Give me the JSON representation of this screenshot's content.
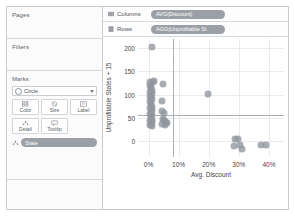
{
  "sidebar": {
    "pages": {
      "title": "Pages"
    },
    "filters": {
      "title": "Filters"
    },
    "marks": {
      "title": "Marks",
      "mark_type": "Circle",
      "buttons": [
        {
          "label": "Color",
          "icon": "color-icon"
        },
        {
          "label": "Size",
          "icon": "size-icon"
        },
        {
          "label": "Label",
          "icon": "label-icon"
        },
        {
          "label": "Detail",
          "icon": "detail-icon"
        },
        {
          "label": "Tooltip",
          "icon": "tooltip-icon"
        }
      ],
      "field_pill": "State"
    }
  },
  "shelves": {
    "columns": {
      "label": "Columns",
      "pill": "AVG(Discount)"
    },
    "rows": {
      "label": "Rows",
      "pill": "AGG(Unprofitable St"
    }
  },
  "chart_data": {
    "type": "scatter",
    "title": "",
    "xlabel": "Avg. Discount",
    "ylabel": "Unprofitable States + 15",
    "xlim": [
      -0.035,
      0.45
    ],
    "ylim": [
      -35,
      220
    ],
    "xticks": [
      0,
      0.1,
      0.2,
      0.3,
      0.4
    ],
    "xticklabels": [
      "0%",
      "10%",
      "20%",
      "30%",
      "40%"
    ],
    "yticks": [
      0,
      50,
      100,
      150,
      200
    ],
    "yticklabels": [
      "0",
      "50",
      "100",
      "150",
      "200"
    ],
    "grid": true,
    "legend": false,
    "reference_lines": [
      {
        "axis": "x",
        "value": 0.08,
        "color": "#a9afb6"
      },
      {
        "axis": "y",
        "value": 55,
        "color": "#a9afb6"
      }
    ],
    "marker": {
      "shape": "circle",
      "color": "#8f969d",
      "opacity": 0.78,
      "size": 7
    },
    "points": [
      {
        "x": 0.012,
        "y": 203
      },
      {
        "x": 0.006,
        "y": 128
      },
      {
        "x": 0.014,
        "y": 126
      },
      {
        "x": 0.019,
        "y": 129
      },
      {
        "x": 0.004,
        "y": 120
      },
      {
        "x": 0.009,
        "y": 117
      },
      {
        "x": 0.007,
        "y": 112
      },
      {
        "x": 0.011,
        "y": 108
      },
      {
        "x": 0.005,
        "y": 105
      },
      {
        "x": 0.01,
        "y": 101
      },
      {
        "x": 0.006,
        "y": 97
      },
      {
        "x": 0.008,
        "y": 93
      },
      {
        "x": 0.012,
        "y": 90
      },
      {
        "x": 0.005,
        "y": 86
      },
      {
        "x": 0.009,
        "y": 82
      },
      {
        "x": 0.007,
        "y": 78
      },
      {
        "x": 0.011,
        "y": 74
      },
      {
        "x": 0.006,
        "y": 70
      },
      {
        "x": 0.01,
        "y": 66
      },
      {
        "x": 0.008,
        "y": 62
      },
      {
        "x": 0.005,
        "y": 58
      },
      {
        "x": 0.012,
        "y": 55
      },
      {
        "x": 0.007,
        "y": 51
      },
      {
        "x": 0.009,
        "y": 47
      },
      {
        "x": 0.006,
        "y": 43
      },
      {
        "x": 0.011,
        "y": 40
      },
      {
        "x": 0.008,
        "y": 37
      },
      {
        "x": 0.004,
        "y": 34
      },
      {
        "x": 0.013,
        "y": 44
      },
      {
        "x": 0.01,
        "y": 31
      },
      {
        "x": 0.047,
        "y": 122
      },
      {
        "x": 0.044,
        "y": 86
      },
      {
        "x": 0.046,
        "y": 65
      },
      {
        "x": 0.05,
        "y": 61
      },
      {
        "x": 0.048,
        "y": 48
      },
      {
        "x": 0.053,
        "y": 44
      },
      {
        "x": 0.058,
        "y": 40
      },
      {
        "x": 0.045,
        "y": 36
      },
      {
        "x": 0.062,
        "y": 38
      },
      {
        "x": 0.056,
        "y": 35
      },
      {
        "x": 0.196,
        "y": 101
      },
      {
        "x": 0.287,
        "y": 4
      },
      {
        "x": 0.297,
        "y": 3
      },
      {
        "x": 0.283,
        "y": -12
      },
      {
        "x": 0.305,
        "y": -8
      },
      {
        "x": 0.312,
        "y": -17
      },
      {
        "x": 0.372,
        "y": -9
      },
      {
        "x": 0.389,
        "y": -9
      }
    ]
  }
}
